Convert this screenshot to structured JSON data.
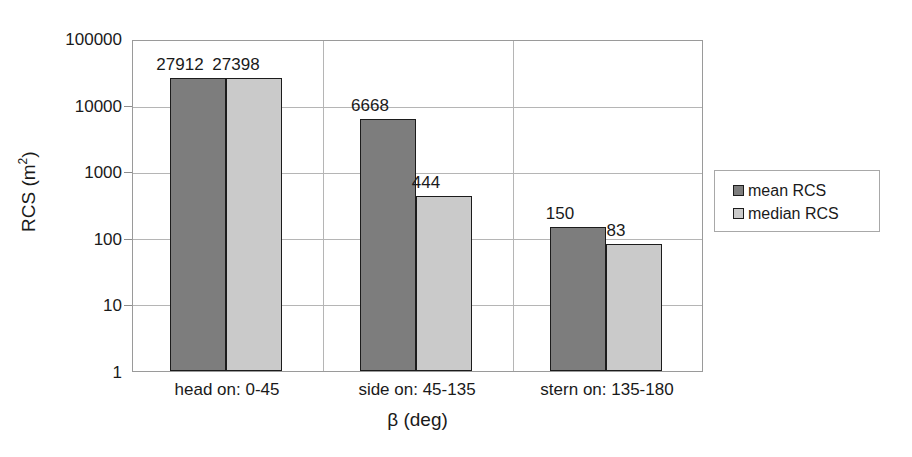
{
  "chart_data": {
    "type": "bar",
    "title": "",
    "subtitle": "",
    "xlabel": "β (deg)",
    "ylabel": "RCS (m2)",
    "ylabel_base": "RCS (m",
    "ylabel_sup": "2",
    "ylabel_tail": ")",
    "yscale": "log",
    "ylim": [
      1,
      100000
    ],
    "grid": true,
    "legend_position": "right",
    "categories": [
      "head on:  0-45",
      "side on: 45-135",
      "stern on: 135-180"
    ],
    "y_ticks": [
      "100000",
      "10000",
      "1000",
      "100",
      "10",
      "1"
    ],
    "y_tick_values": [
      100000,
      10000,
      1000,
      100,
      10,
      1
    ],
    "series": [
      {
        "name": "mean RCS",
        "color": "#7d7d7d",
        "values": [
          27912,
          6668,
          150
        ],
        "labels": [
          "27912",
          "6668",
          "150"
        ]
      },
      {
        "name": "median RCS",
        "color": "#cacaca",
        "values": [
          27398,
          444,
          83
        ],
        "labels": [
          "27398",
          "444",
          "83"
        ]
      }
    ]
  },
  "legend": {
    "items": [
      {
        "label": "mean RCS",
        "swatch": "mean"
      },
      {
        "label": "median RCS",
        "swatch": "median"
      }
    ]
  },
  "axes": {
    "y_title_base": "RCS (m",
    "y_title_sup": "2",
    "y_title_tail": ")",
    "x_title": "β (deg)"
  },
  "colors": {
    "mean_bar": "#7d7d7d",
    "median_bar": "#cacaca",
    "bar_outline": "#1c1c1c",
    "gridline": "#b5b5b5",
    "plot_border": "#9a9a9a",
    "background": "#ffffff",
    "text": "#1a1a1a"
  }
}
